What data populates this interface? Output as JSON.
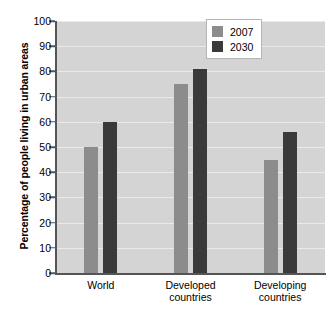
{
  "chart_data": {
    "type": "bar",
    "title": "",
    "xlabel": "",
    "ylabel": "Percentage of people living in urban areas",
    "ylim": [
      0,
      100
    ],
    "yticks": [
      0,
      10,
      20,
      30,
      40,
      50,
      60,
      70,
      80,
      90,
      100
    ],
    "grid": true,
    "legend_position": "top-right",
    "categories": [
      "World",
      "Developed countries",
      "Developing countries"
    ],
    "category_lines": [
      [
        "World"
      ],
      [
        "Developed",
        "countries"
      ],
      [
        "Developing",
        "countries"
      ]
    ],
    "series": [
      {
        "name": "2007",
        "color": "#8c8c8c",
        "values": [
          50,
          75,
          45
        ]
      },
      {
        "name": "2030",
        "color": "#3a3a3a",
        "values": [
          60,
          81,
          56
        ]
      }
    ]
  },
  "legend": {
    "entries": [
      {
        "label": "2007"
      },
      {
        "label": "2030"
      }
    ]
  },
  "colors": {
    "plot_background": "#d4d4d4",
    "gridline": "#eaeaea",
    "axis": "#555555",
    "series_2007": "#8c8c8c",
    "series_2030": "#3a3a3a",
    "page_background": "#ffffff"
  }
}
